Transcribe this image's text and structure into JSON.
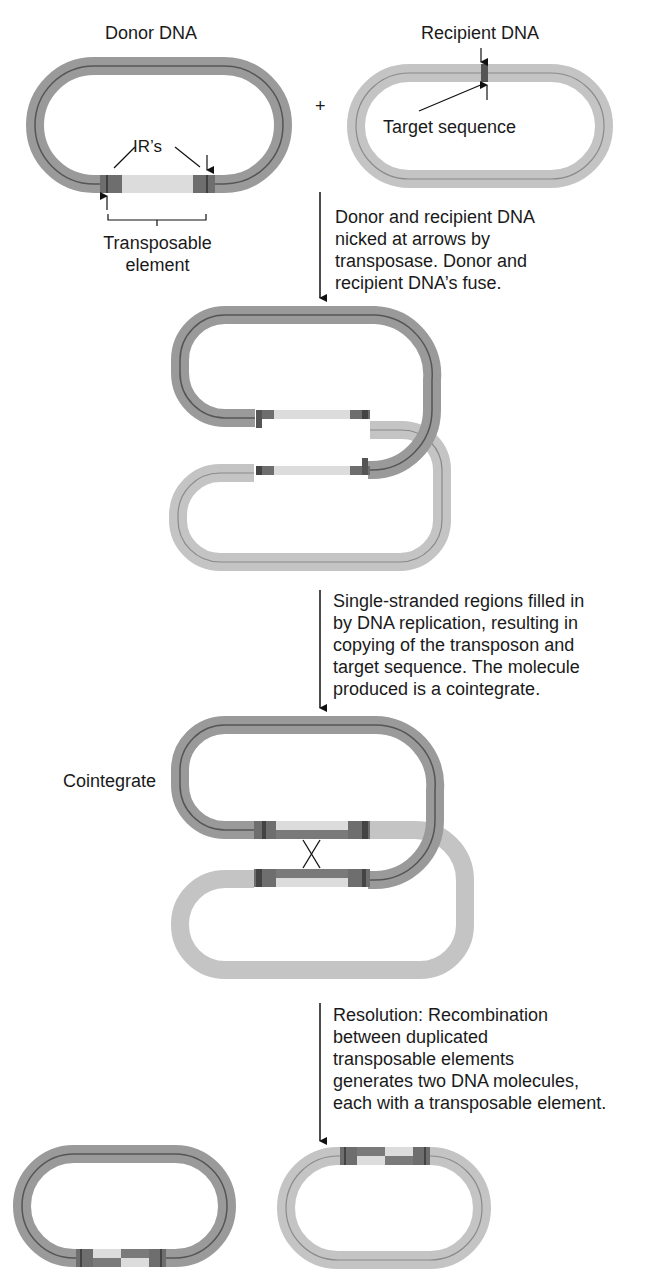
{
  "labels": {
    "donor": "Donor DNA",
    "recipient": "Recipient DNA",
    "plus": "+",
    "irs": "IR’s",
    "target_sequence": "Target sequence",
    "transposable_element": "Transposable\nelement",
    "cointegrate": "Cointegrate"
  },
  "steps": [
    {
      "text": "Donor and recipient DNA\nnicked at arrows by\ntransposase. Donor and\nrecipient DNA’s fuse."
    },
    {
      "text": "Single-stranded regions filled in\nby DNA replication, resulting in\ncopying of the transposon and\ntarget sequence. The molecule\nproduced is a cointegrate."
    },
    {
      "text": "Resolution: Recombination\nbetween duplicated\ntransposable elements\ngenerates two DNA molecules,\neach with a transposable element."
    }
  ],
  "colors": {
    "donor_strand": "#9a9a9a",
    "recipient_strand": "#c4c4c4",
    "inner_line_donor": "#555555",
    "inner_line_recipient": "#8a8a8a",
    "ir_block": "#6e6e6e",
    "ir_block_dark": "#4a4a4a",
    "transposon_light": "#dcdcdc",
    "arrow": "#111111"
  }
}
